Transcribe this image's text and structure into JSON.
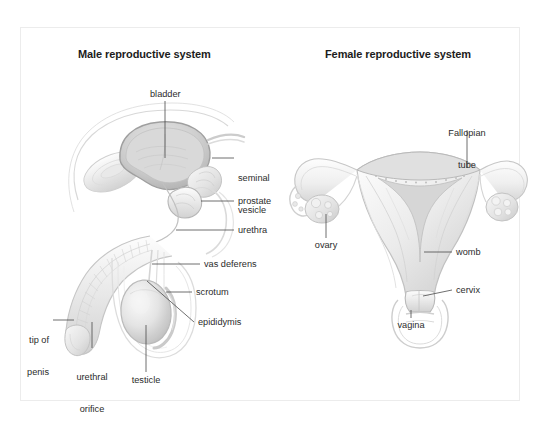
{
  "figure": {
    "background_color": "#ffffff",
    "frame_color": "#ececec",
    "text_color": "#2b2b2b",
    "title_color": "#1c1c1c",
    "leader_line_color": "#4a4a4a"
  },
  "male": {
    "title": "Male reproductive system",
    "labels": [
      {
        "id": "bladder",
        "text": "bladder"
      },
      {
        "id": "seminal-vesicle",
        "line1": "seminal",
        "line2": "vesicle"
      },
      {
        "id": "prostate",
        "text": "prostate"
      },
      {
        "id": "urethra",
        "text": "urethra"
      },
      {
        "id": "vas-deferens",
        "text": "vas deferens"
      },
      {
        "id": "scrotum",
        "text": "scrotum"
      },
      {
        "id": "epididymis",
        "text": "epididymis"
      },
      {
        "id": "tip-of-penis",
        "line1": "tip of",
        "line2": "penis"
      },
      {
        "id": "urethral-orifice",
        "line1": "urethral",
        "line2": "orifice"
      },
      {
        "id": "testicle",
        "text": "testicle"
      }
    ]
  },
  "female": {
    "title": "Female reproductive system",
    "labels": [
      {
        "id": "fallopian-tube",
        "line1": "Fallopian",
        "line2": "tube"
      },
      {
        "id": "ovary",
        "text": "ovary"
      },
      {
        "id": "womb",
        "text": "womb"
      },
      {
        "id": "cervix",
        "text": "cervix"
      },
      {
        "id": "vagina",
        "text": "vagina"
      }
    ]
  }
}
